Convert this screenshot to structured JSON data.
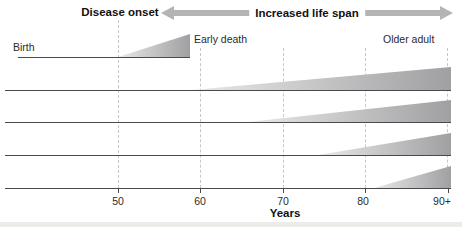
{
  "header": {
    "disease_onset": "Disease onset",
    "increased_life_span": "Increased life span"
  },
  "labels": {
    "birth": "Birth",
    "early_death": "Early death",
    "older_adult": "Older adult"
  },
  "axis": {
    "ticks": [
      "50",
      "60",
      "70",
      "80",
      "90+"
    ],
    "xlabel": "Years"
  },
  "rows": [
    {
      "name": "timeline-1",
      "morbidity_onset_age": 50,
      "end_age": "59 (early death)"
    },
    {
      "name": "timeline-2",
      "morbidity_onset_age": 59,
      "end_age": "90+"
    },
    {
      "name": "timeline-3",
      "morbidity_onset_age": 66,
      "end_age": "90+"
    },
    {
      "name": "timeline-4",
      "morbidity_onset_age": 74,
      "end_age": "90+"
    },
    {
      "name": "timeline-5",
      "morbidity_onset_age": 81,
      "end_age": "90+"
    }
  ],
  "colors": {
    "arrow_gray": "#b4b4b4",
    "wedge_light": "#e9e9e9",
    "wedge_dark": "#a0a0a3",
    "line": "#4a4a4a",
    "gridline_dash": "#c6c6c6",
    "text": "#1a1a1a"
  }
}
